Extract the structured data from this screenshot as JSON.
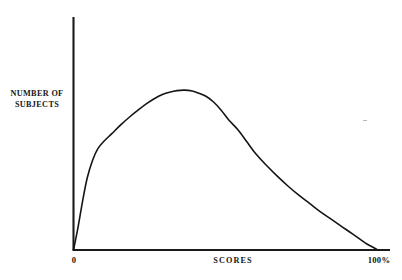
{
  "figure": {
    "background_color": "#ffffff",
    "ink_color": "#151515",
    "axis_color": "#1a1a1a",
    "y_axis_label_lines": [
      "NUMBER OF",
      "SUBJECTS"
    ],
    "x_axis_title": "SCORES",
    "x_tick_labels": [
      "0",
      "100%"
    ]
  },
  "chart_data": {
    "type": "line",
    "title": "",
    "subtitle": "",
    "xlabel": "SCORES",
    "ylabel": "NUMBER OF SUBJECTS",
    "xlim": [
      0,
      100
    ],
    "ylim": [
      0,
      100
    ],
    "x_tick_labels": [
      "0",
      "100%"
    ],
    "x_ticks": [
      0,
      100
    ],
    "y_ticks": [],
    "y_tick_labels": [],
    "grid": false,
    "legend": null,
    "legend_position": "none",
    "annotations": [],
    "series": [
      {
        "name": "Score distribution",
        "color": "#151515",
        "line_width": 1.6,
        "x": [
          0,
          1.5,
          3,
          4.5,
          6.3,
          8,
          10,
          12.5,
          15.5,
          18.5,
          21.5,
          24,
          26.5,
          29,
          31.5,
          34,
          36.5,
          39,
          41,
          43.5,
          46,
          48.5,
          51,
          54,
          57,
          60,
          63.5,
          67,
          70.5,
          74,
          77.5,
          81,
          84.5,
          88,
          91.5,
          94.5,
          96.5,
          100
        ],
        "y": [
          0,
          14,
          30,
          44,
          55,
          62,
          66.5,
          71,
          76.5,
          81.5,
          86,
          89.5,
          92.5,
          95,
          96.5,
          97.5,
          97.8,
          97.2,
          96,
          94,
          90.5,
          85.5,
          79.5,
          73.5,
          66,
          58.5,
          51.5,
          45,
          39,
          33.5,
          28.5,
          23.5,
          19,
          14.5,
          10,
          6,
          3.5,
          0
        ]
      }
    ]
  }
}
